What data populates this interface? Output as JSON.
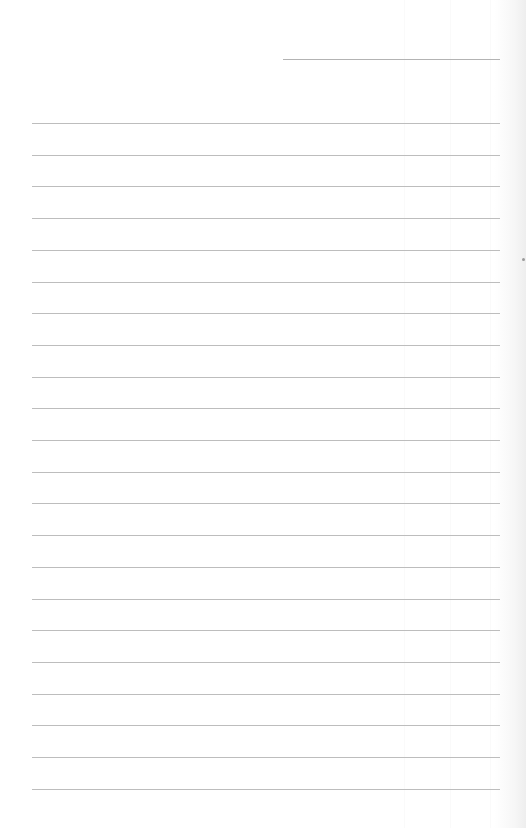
{
  "page": {
    "type": "lined-paper",
    "background_color": "#ffffff",
    "rule_color": "#bdbdbd"
  },
  "header": {
    "title_line": {
      "x": 283,
      "y": 59,
      "width": 217,
      "value": ""
    }
  },
  "ruled_lines": {
    "count": 22,
    "left": 32,
    "width": 468,
    "first_y": 123,
    "spacing": 31.7,
    "entries": [
      "",
      "",
      "",
      "",
      "",
      "",
      "",
      "",
      "",
      "",
      "",
      "",
      "",
      "",
      "",
      "",
      "",
      "",
      "",
      "",
      "",
      ""
    ]
  },
  "marks": [
    {
      "name": "edge-speck",
      "x": 522,
      "y": 258
    }
  ]
}
